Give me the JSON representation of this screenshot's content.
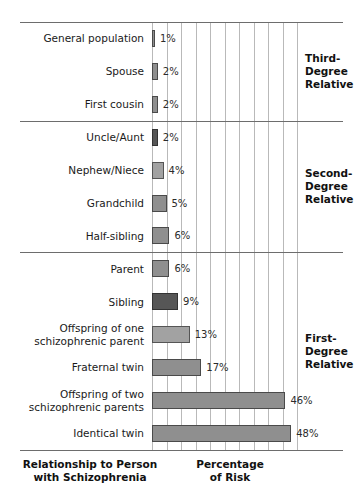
{
  "chart_data": {
    "type": "bar",
    "orientation": "horizontal",
    "title": "",
    "xlabel": "Percentage\nof Risk",
    "ylabel": "Relationship to Person\nwith Schizophrenia",
    "xlim": [
      0,
      50
    ],
    "grid": true,
    "grid_interval": 5,
    "value_suffix": "%",
    "categories": [
      "General population",
      "Spouse",
      "First cousin",
      "Uncle/Aunt",
      "Nephew/Niece",
      "Grandchild",
      "Half-sibling",
      "Parent",
      "Sibling",
      "Offspring of one\nschizophrenic parent",
      "Fraternal twin",
      "Offspring of two\nschizophrenic parents",
      "Identical twin"
    ],
    "values": [
      1,
      2,
      2,
      2,
      4,
      5,
      6,
      6,
      9,
      13,
      17,
      46,
      48
    ],
    "value_labels": [
      "1%",
      "2%",
      "2%",
      "2%",
      "4%",
      "5%",
      "6%",
      "6%",
      "9%",
      "13%",
      "17%",
      "46%",
      "48%"
    ],
    "bar_shades": [
      "medium",
      "medium",
      "medium",
      "dark",
      "light",
      "medium",
      "medium",
      "medium",
      "dark",
      "light",
      "medium",
      "medium",
      "medium"
    ],
    "groups": [
      {
        "label": "Third-\nDegree\nRelative",
        "categories": [
          "General population",
          "Spouse",
          "First cousin"
        ]
      },
      {
        "label": "Second-\nDegree\nRelative",
        "categories": [
          "Uncle/Aunt",
          "Nephew/Niece",
          "Grandchild",
          "Half-sibling"
        ]
      },
      {
        "label": "First-\nDegree\nRelative",
        "categories": [
          "Parent",
          "Sibling",
          "Offspring of one schizophrenic parent",
          "Fraternal twin",
          "Offspring of two schizophrenic parents",
          "Identical twin"
        ]
      }
    ],
    "colors": {
      "bar_medium": "#8f8f8f",
      "bar_dark": "#565656",
      "bar_light": "#a2a2a2",
      "bar_border": "#4a4a4a",
      "gridline": "#b9b9b9",
      "rule": "#6d6d6d",
      "text": "#1a1a1a",
      "background": "#ffffff"
    }
  }
}
